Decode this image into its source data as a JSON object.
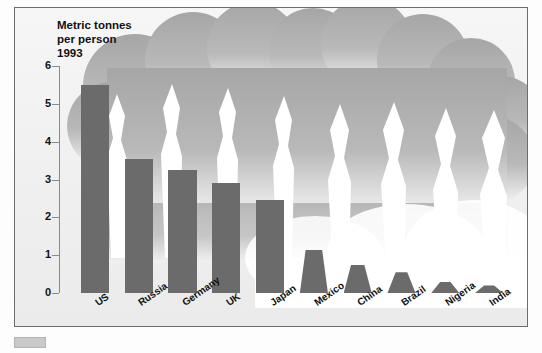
{
  "chart_data": {
    "type": "bar",
    "title": "Metric tonnes per person 1993",
    "title_lines": [
      "Metric tonnes",
      "per person",
      "1993"
    ],
    "xlabel": "",
    "ylabel": "Metric tonnes per person",
    "ylim": [
      0,
      6
    ],
    "yticks": [
      0,
      1,
      2,
      3,
      4,
      5,
      6
    ],
    "ytick_labels": [
      "0",
      "1",
      "2",
      "3",
      "4",
      "5",
      "6"
    ],
    "grid": false,
    "legend": "none",
    "categories": [
      "US",
      "Russia",
      "Germany",
      "UK",
      "Japan",
      "Mexico",
      "China",
      "Brazil",
      "Nigeria",
      "India"
    ],
    "values": [
      5.5,
      3.55,
      3.25,
      2.9,
      2.45,
      1.15,
      0.75,
      0.55,
      0.3,
      0.2
    ],
    "bar_color": "#6b6b6b",
    "cloud_color": "#a8a8a8",
    "plume_color": "#ffffff",
    "background_color": "#f2f2f2",
    "annotations": [
      "Large grey smoke cloud fills the upper plot area",
      "White smoke plumes rise from each bar into the cloud",
      "Bars for smaller values are drawn as tapered smokestacks"
    ]
  },
  "figure": {
    "frame_border_color": "#6d6d6d",
    "swatch_label": ""
  }
}
